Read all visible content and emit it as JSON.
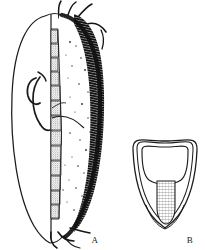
{
  "plate": {
    "title": "Scientific illustration plate",
    "background_color": "#ffffff",
    "ink_color": "#151515",
    "width": 205,
    "height": 250,
    "medium": "black-and-white engraved line drawing"
  },
  "figures": [
    {
      "id": "A",
      "label": "A",
      "label_x": 95,
      "label_y": 243,
      "caption": "A",
      "description": "Lateral view of elongate oval carapace valve",
      "parts": [
        {
          "name": "outer-valve-outline",
          "label": "outer valve outline"
        },
        {
          "name": "thick-striated-margin",
          "label": "thick striated dorsal-posterior margin"
        },
        {
          "name": "median-axis-line",
          "label": "median axis line"
        },
        {
          "name": "segment-chain",
          "label": "chain of stippled segments",
          "count": 13
        },
        {
          "name": "internal-hook",
          "label": "internal hook-shaped structure"
        },
        {
          "name": "dorsal-setae",
          "label": "dorsal setae",
          "count": 4
        },
        {
          "name": "ventral-setae",
          "label": "ventral setae",
          "count": 3
        },
        {
          "name": "stipple-field",
          "label": "scattered stipple marks"
        }
      ]
    },
    {
      "id": "B",
      "label": "B",
      "label_x": 190,
      "label_y": 243,
      "caption": "B",
      "description": "Cross-sectional end view with nested walls and hatched central column",
      "parts": [
        {
          "name": "outer-wall-outline",
          "label": "outer wall outline"
        },
        {
          "name": "middle-wall-outline",
          "label": "middle wall outline"
        },
        {
          "name": "inner-chamber-outline",
          "label": "inner chamber outline"
        },
        {
          "name": "hatched-column",
          "label": "cross-hatched central column"
        }
      ]
    }
  ],
  "colors": {
    "ink": "#151515",
    "dark_fill": "#0d0d0d",
    "mid_grey": "#6b6b6b",
    "light_grey": "#b5b5b5",
    "paper": "#ffffff"
  }
}
